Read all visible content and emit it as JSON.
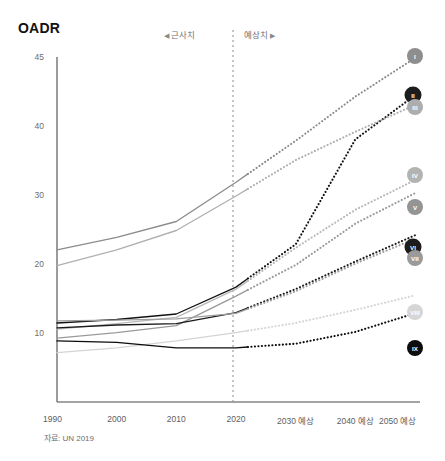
{
  "header": {
    "title": "OADR"
  },
  "annotations": {
    "historical_label": "근사치",
    "historical_arrow": "◀",
    "forecast_label": "예상치",
    "forecast_arrow": "▶",
    "divider_year": 2022
  },
  "source_note": "자료: UN 2019",
  "chart_data": {
    "type": "line",
    "title": "OADR",
    "xlabel": "",
    "ylabel": "OADR",
    "grid": false,
    "legend_position": "right-end-labels",
    "x": [
      1990,
      2000,
      2010,
      2020,
      2030,
      2040,
      2050
    ],
    "xticklabels": [
      "1990",
      "2000",
      "2010",
      "2020",
      "2030 예상",
      "2040 예상",
      "2050 예상"
    ],
    "yticks": [
      10,
      20,
      30,
      40,
      45
    ],
    "yticklabels": [
      "10",
      "20",
      "30",
      "40",
      "45"
    ],
    "ylim": [
      5,
      45
    ],
    "forecast_starts": 2022,
    "series": [
      {
        "name": "I",
        "label": "I",
        "color": "#8c8c8c",
        "values": [
          22.2,
          24.0,
          26.3,
          32.0,
          38.0,
          42.2,
          45.0
        ],
        "end_value": 45.0
      },
      {
        "name": "II",
        "label": "II",
        "color": "#111111",
        "values": [
          11.6,
          12.1,
          12.9,
          16.8,
          23.0,
          38.2,
          42.3
        ],
        "end_value": 42.3
      },
      {
        "name": "III",
        "label": "III",
        "color": "#b0b0b0",
        "values": [
          19.9,
          22.2,
          25.0,
          30.0,
          35.2,
          39.3,
          41.6
        ],
        "end_value": 41.6
      },
      {
        "name": "IV",
        "label": "IV",
        "color": "#b8b8b8",
        "values": [
          10.7,
          11.5,
          12.4,
          16.5,
          22.5,
          28.0,
          32.3
        ],
        "end_value": 32.3
      },
      {
        "name": "V",
        "label": "V",
        "color": "#9a9a9a",
        "values": [
          9.4,
          10.2,
          11.2,
          15.5,
          20.0,
          26.0,
          30.4
        ],
        "end_value": 30.4
      },
      {
        "name": "VI",
        "label": "VI",
        "color": "#1a1a1a",
        "values": [
          10.9,
          11.3,
          11.5,
          13.1,
          16.5,
          20.5,
          24.3
        ],
        "end_value": 24.3
      },
      {
        "name": "VII",
        "label": "VII",
        "color": "#9e9e9e",
        "values": [
          11.9,
          12.0,
          12.2,
          13.0,
          16.2,
          20.2,
          23.8
        ],
        "end_value": 23.8
      },
      {
        "name": "VIII",
        "label": "VIII",
        "color": "#d4d4d4",
        "values": [
          7.3,
          8.0,
          9.0,
          10.2,
          11.6,
          13.5,
          15.6
        ],
        "end_value": 15.6
      },
      {
        "name": "IX",
        "label": "IX",
        "color": "#0d0d0d",
        "values": [
          9.0,
          8.8,
          8.0,
          8.0,
          8.6,
          10.3,
          13.0
        ],
        "end_value": 13.0
      }
    ]
  },
  "geometry": {
    "plot_left": 57,
    "plot_right": 415,
    "plot_top": 57,
    "plot_bottom": 402,
    "divider_x": 233,
    "y_tick_pixels": {
      "45": 58,
      "40": 127,
      "30": 196,
      "20": 265,
      "10": 334
    },
    "x_tick_pixels": {
      "1990": 57,
      "2000": 116,
      "2010": 176,
      "2020": 236,
      "2030": 296,
      "2040": 356,
      "2050": 415
    },
    "badges": [
      {
        "label": "I",
        "cx": 415,
        "cy": 56,
        "r": 8,
        "fill": "#8e8e8e"
      },
      {
        "label": "II",
        "cx": 413,
        "cy": 95,
        "r": 8.5,
        "fill": "#1c1c1c"
      },
      {
        "label": "III",
        "cx": 415,
        "cy": 107,
        "r": 8,
        "fill": "#adadad"
      },
      {
        "label": "IV",
        "cx": 415,
        "cy": 175,
        "r": 8,
        "fill": "#b3b3b3"
      },
      {
        "label": "V",
        "cx": 415,
        "cy": 207,
        "r": 8,
        "fill": "#949494"
      },
      {
        "label": "VI",
        "cx": 413,
        "cy": 247,
        "r": 8.5,
        "fill": "#1c1c1c"
      },
      {
        "label": "VII",
        "cx": 415,
        "cy": 258,
        "r": 8,
        "fill": "#9a9a9a"
      },
      {
        "label": "VIII",
        "cx": 415,
        "cy": 312,
        "r": 8,
        "fill": "#d6d6d6"
      },
      {
        "label": "IX",
        "cx": 415,
        "cy": 348,
        "r": 8,
        "fill": "#0d0d0d"
      }
    ]
  }
}
